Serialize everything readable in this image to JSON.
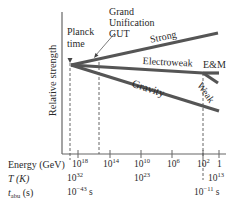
{
  "diagram": {
    "ylabel": "Relative strength",
    "annotations": {
      "planck_line1": "Planck",
      "planck_line2": "time",
      "gut_line1": "Grand",
      "gut_line2": "Unification",
      "gut_line3": "GUT"
    },
    "forces": {
      "strong": "Strong",
      "electroweak": "Electroweak",
      "em": "E&M",
      "weak": "Weak",
      "gravity": "Gravity"
    },
    "rows": {
      "energy_label": "Energy (GeV)",
      "temperature_label": "T (K)",
      "time_label_main": "t",
      "time_label_sub": "abu",
      "time_label_unit": " (s)"
    },
    "energy_ticks": [
      {
        "base": "10",
        "exp": "18"
      },
      {
        "base": "10",
        "exp": "14"
      },
      {
        "base": "10",
        "exp": "10"
      },
      {
        "base": "10",
        "exp": "6"
      },
      {
        "base": "10",
        "exp": "2"
      },
      {
        "base": "1",
        "exp": ""
      }
    ],
    "temperature_values": [
      {
        "base": "10",
        "exp": "32"
      },
      {
        "base": "10",
        "exp": "23"
      },
      {
        "base": "10",
        "exp": "13"
      }
    ],
    "time_values": [
      {
        "base": "10",
        "exp": "−43",
        "unit": " s"
      },
      {
        "base": "10",
        "exp": "−11",
        "unit": " s"
      }
    ],
    "colors": {
      "line": "#555555",
      "axis": "#555555",
      "text": "#2a2a2a"
    }
  }
}
